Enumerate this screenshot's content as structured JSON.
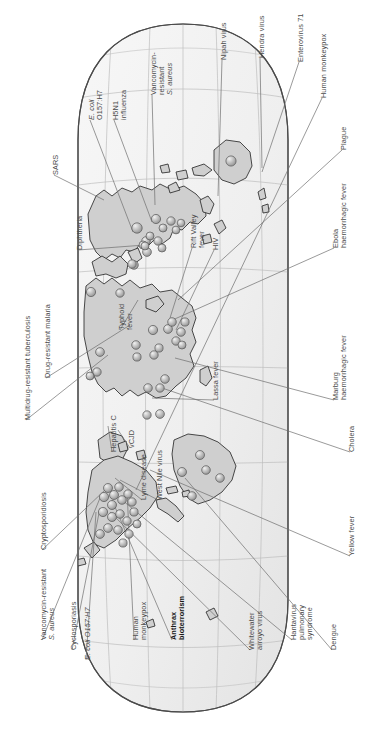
{
  "figure": {
    "orientation": "map rotated 90 degrees counter-clockwise",
    "projection": "oval / Robinson-like world projection",
    "marker_legend": "shaded 3D sphere = reported disease outbreak location",
    "colors": {
      "land": "#cfcfcf",
      "land_stroke": "#2b2b2b",
      "ocean": "#f2f2f2",
      "graticule": "#b9b9b9",
      "globe_edge": "#555555",
      "marker_fill": "#b4b4b4",
      "marker_highlight": "#e8e8e8",
      "marker_stroke": "#585858",
      "leader_line": "#6b6b6b",
      "label_text": "#4a4a4a",
      "label_bold_text": "#1a1a1a",
      "background": "#ffffff"
    }
  },
  "labels": [
    {
      "id": "sars",
      "text": "SARS",
      "style": "plain",
      "x": 52,
      "y": 175,
      "anchor": [
        104,
        200
      ]
    },
    {
      "id": "ecoli-top",
      "text": "E. coli\nO157:H7",
      "style": "italic-first",
      "x": 88,
      "y": 120,
      "anchor": [
        133,
        232
      ]
    },
    {
      "id": "h5n1",
      "text": "H5N1\ninfluenza",
      "style": "plain",
      "x": 112,
      "y": 120,
      "anchor": [
        152,
        222
      ]
    },
    {
      "id": "vrsa-top",
      "text": "Vancomycin-\nresistant\nS. aureus",
      "style": "italic-last",
      "x": 150,
      "y": 95,
      "anchor": [
        155,
        205
      ]
    },
    {
      "id": "nipah",
      "text": "Nipah virus",
      "style": "plain",
      "x": 220,
      "y": 60,
      "anchor": [
        218,
        196
      ]
    },
    {
      "id": "hendra",
      "text": "Hendra virus",
      "style": "plain",
      "x": 258,
      "y": 58,
      "anchor": [
        262,
        168
      ]
    },
    {
      "id": "enterovirus71",
      "text": "Enterovirus 71",
      "style": "plain",
      "x": 297,
      "y": 62,
      "anchor": [
        262,
        172
      ]
    },
    {
      "id": "human-monkeypox-r",
      "text": "Human monkeypox",
      "style": "plain",
      "x": 320,
      "y": 98,
      "anchor": [
        136,
        490
      ]
    },
    {
      "id": "plague",
      "text": "Plague",
      "style": "plain",
      "x": 340,
      "y": 150,
      "anchor": [
        178,
        300
      ]
    },
    {
      "id": "ebola",
      "text": "Ebola\nhaemorrhagic fever",
      "style": "plain",
      "x": 332,
      "y": 248,
      "anchor": [
        168,
        322
      ]
    },
    {
      "id": "marburg",
      "text": "Marburg\nhaemorrhagic fever",
      "style": "plain",
      "x": 332,
      "y": 400,
      "anchor": [
        175,
        358
      ]
    },
    {
      "id": "cholera",
      "text": "Cholera",
      "style": "plain",
      "x": 348,
      "y": 452,
      "anchor": [
        162,
        388
      ]
    },
    {
      "id": "yellow-fever",
      "text": "Yellow fever",
      "style": "plain",
      "x": 348,
      "y": 556,
      "anchor": [
        150,
        470
      ]
    },
    {
      "id": "dengue",
      "text": "Dengue",
      "style": "plain",
      "x": 330,
      "y": 650,
      "anchor": [
        185,
        478
      ]
    },
    {
      "id": "hantavirus",
      "text": "Hantavirus\npulmonary\nsyndrome",
      "style": "plain",
      "x": 290,
      "y": 640,
      "anchor": [
        122,
        500
      ]
    },
    {
      "id": "whitewater",
      "text": "Whitewater\narroyo virus",
      "style": "plain",
      "x": 248,
      "y": 650,
      "anchor": [
        110,
        512
      ]
    },
    {
      "id": "anthrax",
      "text": "Anthrax\nbioterrorism",
      "style": "bold",
      "x": 170,
      "y": 640,
      "anchor": [
        112,
        500
      ]
    },
    {
      "id": "human-monkeypox",
      "text": "Human\nmonkeypox",
      "style": "plain",
      "x": 132,
      "y": 640,
      "anchor": [
        127,
        490
      ]
    },
    {
      "id": "ecoli-bottom",
      "text": "E. coli O157:H7",
      "style": "italic-first",
      "x": 84,
      "y": 660,
      "anchor": [
        96,
        512
      ]
    },
    {
      "id": "cyclosporiasis",
      "text": "Cyclosporiasis",
      "style": "plain",
      "x": 70,
      "y": 650,
      "anchor": [
        100,
        508
      ]
    },
    {
      "id": "vrsa-bottom",
      "text": "Vancomycin-resistant\nS. aureus",
      "style": "italic-last",
      "x": 40,
      "y": 640,
      "anchor": [
        100,
        498
      ]
    },
    {
      "id": "cryptosporidiosis",
      "text": "Cryptosporidiosis",
      "style": "plain",
      "x": 40,
      "y": 550,
      "anchor": [
        105,
        490
      ]
    },
    {
      "id": "lyme",
      "text": "Lyme disease",
      "style": "plain",
      "x": 140,
      "y": 500,
      "anchor": [
        115,
        478
      ]
    },
    {
      "id": "west-nile",
      "text": "West Nile virus",
      "style": "plain",
      "x": 156,
      "y": 500,
      "anchor": [
        120,
        480
      ]
    },
    {
      "id": "vcjd",
      "text": "vCJD",
      "style": "plain",
      "x": 128,
      "y": 448,
      "anchor": [
        118,
        430
      ]
    },
    {
      "id": "hepatitis-c",
      "text": "Hepatitis C",
      "style": "plain",
      "x": 110,
      "y": 452,
      "anchor": [
        108,
        426
      ]
    },
    {
      "id": "mdr-tb",
      "text": "Multidrug-resistant tuberculosis",
      "style": "plain",
      "x": 24,
      "y": 420,
      "anchor": [
        108,
        355
      ]
    },
    {
      "id": "dr-malaria",
      "text": "Drug-resistant malaria",
      "style": "plain",
      "x": 44,
      "y": 378,
      "anchor": [
        130,
        325
      ]
    },
    {
      "id": "diphtheria",
      "text": "Diphtheria",
      "style": "plain",
      "x": 76,
      "y": 250,
      "anchor": [
        145,
        245
      ]
    },
    {
      "id": "typhoid",
      "text": "Typhoid\nfever",
      "style": "plain",
      "x": 118,
      "y": 330,
      "anchor": [
        138,
        300
      ]
    },
    {
      "id": "rift-valley",
      "text": "Rift Valley\nfever",
      "style": "plain",
      "x": 190,
      "y": 248,
      "anchor": [
        170,
        318
      ]
    },
    {
      "id": "hiv",
      "text": "HIV",
      "style": "plain",
      "x": 212,
      "y": 250,
      "anchor": [
        176,
        330
      ]
    },
    {
      "id": "lassa",
      "text": "Lassa fever",
      "style": "plain",
      "x": 212,
      "y": 400,
      "anchor": [
        152,
        398
      ]
    }
  ],
  "markers": [
    {
      "x": 137,
      "y": 228,
      "r": 5.2
    },
    {
      "x": 146,
      "y": 241,
      "r": 4.3
    },
    {
      "x": 156,
      "y": 219,
      "r": 4.6
    },
    {
      "x": 150,
      "y": 236,
      "r": 4.0
    },
    {
      "x": 158,
      "y": 241,
      "r": 4.2
    },
    {
      "x": 163,
      "y": 228,
      "r": 4.0
    },
    {
      "x": 171,
      "y": 221,
      "r": 4.2
    },
    {
      "x": 176,
      "y": 230,
      "r": 3.9
    },
    {
      "x": 181,
      "y": 223,
      "r": 3.8
    },
    {
      "x": 162,
      "y": 248,
      "r": 4.0
    },
    {
      "x": 147,
      "y": 252,
      "r": 4.4
    },
    {
      "x": 143,
      "y": 245,
      "r": 4.0
    },
    {
      "x": 231,
      "y": 161,
      "r": 5.1
    },
    {
      "x": 145,
      "y": 246,
      "r": 4.0
    },
    {
      "x": 134,
      "y": 265,
      "r": 4.3
    },
    {
      "x": 132,
      "y": 264,
      "r": 4.2
    },
    {
      "x": 91,
      "y": 292,
      "r": 4.6
    },
    {
      "x": 120,
      "y": 293,
      "r": 4.2
    },
    {
      "x": 153,
      "y": 330,
      "r": 4.6
    },
    {
      "x": 168,
      "y": 329,
      "r": 4.4
    },
    {
      "x": 172,
      "y": 322,
      "r": 4.3
    },
    {
      "x": 181,
      "y": 332,
      "r": 4.3
    },
    {
      "x": 185,
      "y": 322,
      "r": 4.1
    },
    {
      "x": 176,
      "y": 341,
      "r": 4.2
    },
    {
      "x": 182,
      "y": 345,
      "r": 4.0
    },
    {
      "x": 159,
      "y": 348,
      "r": 4.1
    },
    {
      "x": 136,
      "y": 345,
      "r": 4.3
    },
    {
      "x": 154,
      "y": 355,
      "r": 4.2
    },
    {
      "x": 137,
      "y": 357,
      "r": 4.1
    },
    {
      "x": 165,
      "y": 379,
      "r": 4.3
    },
    {
      "x": 148,
      "y": 388,
      "r": 4.3
    },
    {
      "x": 160,
      "y": 388,
      "r": 4.2
    },
    {
      "x": 100,
      "y": 352,
      "r": 4.4
    },
    {
      "x": 97,
      "y": 372,
      "r": 4.2
    },
    {
      "x": 90,
      "y": 376,
      "r": 4.0
    },
    {
      "x": 147,
      "y": 415,
      "r": 4.2
    },
    {
      "x": 160,
      "y": 414,
      "r": 4.4
    },
    {
      "x": 200,
      "y": 455,
      "r": 4.5
    },
    {
      "x": 182,
      "y": 472,
      "r": 4.5
    },
    {
      "x": 206,
      "y": 470,
      "r": 4.3
    },
    {
      "x": 220,
      "y": 478,
      "r": 4.3
    },
    {
      "x": 192,
      "y": 496,
      "r": 4.3
    },
    {
      "x": 108,
      "y": 488,
      "r": 4.5
    },
    {
      "x": 114,
      "y": 495,
      "r": 4.5
    },
    {
      "x": 119,
      "y": 487,
      "r": 4.3
    },
    {
      "x": 104,
      "y": 497,
      "r": 4.6
    },
    {
      "x": 112,
      "y": 505,
      "r": 4.5
    },
    {
      "x": 122,
      "y": 500,
      "r": 4.3
    },
    {
      "x": 128,
      "y": 494,
      "r": 4.2
    },
    {
      "x": 132,
      "y": 502,
      "r": 4.2
    },
    {
      "x": 103,
      "y": 512,
      "r": 4.6
    },
    {
      "x": 112,
      "y": 517,
      "r": 4.5
    },
    {
      "x": 120,
      "y": 514,
      "r": 4.3
    },
    {
      "x": 127,
      "y": 521,
      "r": 4.2
    },
    {
      "x": 134,
      "y": 512,
      "r": 4.1
    },
    {
      "x": 108,
      "y": 528,
      "r": 4.4
    },
    {
      "x": 118,
      "y": 530,
      "r": 4.3
    },
    {
      "x": 129,
      "y": 534,
      "r": 4.2
    },
    {
      "x": 100,
      "y": 534,
      "r": 4.4
    },
    {
      "x": 137,
      "y": 524,
      "r": 4.0
    },
    {
      "x": 123,
      "y": 543,
      "r": 4.1
    }
  ]
}
